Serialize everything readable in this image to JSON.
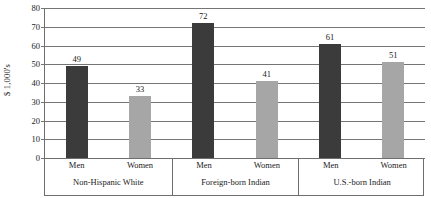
{
  "chart_data": {
    "type": "bar",
    "title": "",
    "subtitle": "",
    "xlabel": "",
    "ylabel": "$ 1,000's",
    "ylim": [
      0,
      80
    ],
    "ytick_step": 10,
    "yticks": [
      0,
      10,
      20,
      30,
      40,
      50,
      60,
      70,
      80
    ],
    "ytick_labels": [
      "0",
      "10",
      "20",
      "30",
      "40",
      "50",
      "60",
      "70",
      "80"
    ],
    "grid": true,
    "legend": "none",
    "categories": [
      "Non-Hispanic White",
      "Foreign-born Indian",
      "U.S.-born Indian"
    ],
    "subcategories": [
      "Men",
      "Women"
    ],
    "series": [
      {
        "name": "Men",
        "values": [
          49,
          72,
          61
        ],
        "color": "#3b3b3b"
      },
      {
        "name": "Women",
        "values": [
          33,
          41,
          51
        ],
        "color": "#a6a6a6"
      }
    ],
    "bars": [
      {
        "group": "Non-Hispanic White",
        "sub": "Men",
        "value": 49,
        "label": "49",
        "color": "#3b3b3b"
      },
      {
        "group": "Non-Hispanic White",
        "sub": "Women",
        "value": 33,
        "label": "33",
        "color": "#a6a6a6"
      },
      {
        "group": "Foreign-born Indian",
        "sub": "Men",
        "value": 72,
        "label": "72",
        "color": "#3b3b3b"
      },
      {
        "group": "Foreign-born Indian",
        "sub": "Women",
        "value": 41,
        "label": "41",
        "color": "#a6a6a6"
      },
      {
        "group": "U.S.-born Indian",
        "sub": "Men",
        "value": 61,
        "label": "61",
        "color": "#3b3b3b"
      },
      {
        "group": "U.S.-born Indian",
        "sub": "Women",
        "value": 51,
        "label": "51",
        "color": "#a6a6a6"
      }
    ],
    "colors": {
      "men_bar": "#3b3b3b",
      "women_bar": "#a6a6a6",
      "gridline": "#757575",
      "axis": "#6e6e6e",
      "text": "#1b1b1b",
      "background": "#ffffff"
    }
  }
}
